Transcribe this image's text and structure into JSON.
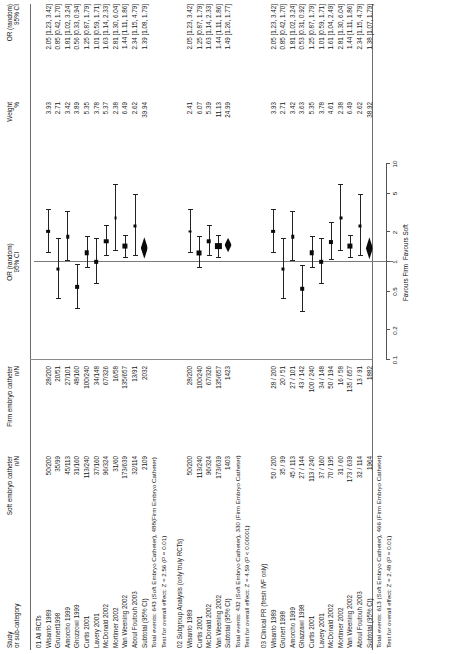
{
  "headers": {
    "study_l1": "Study",
    "study_l2": "or sub-category",
    "soft_l1": "Soft embryo catheter",
    "soft_l2": "n/N",
    "firm_l1": "Firm embryo catheter",
    "firm_l2": "n/N",
    "plot_l1": "OR (random)",
    "plot_l2": "95% CI",
    "weight_l1": "Weight",
    "weight_l2": "%",
    "or_l1": "OR (random)",
    "or_l2": "95% CI"
  },
  "axis": {
    "ticks": [
      "0.1",
      "0.2",
      "0.5",
      "1",
      "2",
      "5",
      "10"
    ],
    "favours_left": "Favours Firm",
    "favours_right": "Favours Soft"
  },
  "chart_data": {
    "type": "forest",
    "xlabel": "OR (random) 95% CI",
    "xscale": "log",
    "xlim": [
      0.1,
      10
    ],
    "xticks": [
      0.1,
      0.2,
      0.5,
      1,
      2,
      5,
      10
    ],
    "null_line": 1,
    "favours_left": "Favours Firm",
    "favours_right": "Favours Soft",
    "sections": [
      {
        "id": "01",
        "label": "01 All RCTs",
        "rows": [
          {
            "study": "Wisanto 1989",
            "soft": "50/200",
            "firm": "28/200",
            "weight": "3.93",
            "or": "2.05 [1.23, 3.42]",
            "est": 2.05,
            "lo": 1.23,
            "hi": 3.42
          },
          {
            "study": "Grunert1998",
            "soft": "35/99",
            "firm": "20/51",
            "weight": "2.71",
            "or": "0.85 [0.42, 1.70]",
            "est": 0.85,
            "lo": 0.42,
            "hi": 1.7
          },
          {
            "study": "Amorcho 1999",
            "soft": "45/113",
            "firm": "27/101",
            "weight": "3.42",
            "or": "1.81 [1.02, 3.24]",
            "est": 1.81,
            "lo": 1.02,
            "hi": 3.24
          },
          {
            "study": "Ghozzowi 1999",
            "soft": "31/160",
            "firm": "48/160",
            "weight": "3.89",
            "or": "0.56 [0.33, 0.94]",
            "est": 0.56,
            "lo": 0.33,
            "hi": 0.94
          },
          {
            "study": "Curtis 2001",
            "soft": "113/240",
            "firm": "100/240",
            "weight": "5.35",
            "or": "1.25 [0.87, 1.79]",
            "est": 1.25,
            "lo": 0.87,
            "hi": 1.79
          },
          {
            "study": "Lavery 2001",
            "soft": "37/160",
            "firm": "34/148",
            "weight": "3.78",
            "or": "1.01 [0.59, 1.71]",
            "est": 1.01,
            "lo": 0.59,
            "hi": 1.71
          },
          {
            "study": "McDonald 2002",
            "soft": "96/324",
            "firm": "67/326",
            "weight": "5.37",
            "or": "1.63 [1.14, 2.33]",
            "est": 1.63,
            "lo": 1.14,
            "hi": 2.33
          },
          {
            "study": "Mortimer 2002",
            "soft": "31/60",
            "firm": "16/58",
            "weight": "2.38",
            "or": "2.81 [1.30, 6.04]",
            "est": 2.81,
            "lo": 1.3,
            "hi": 6.04
          },
          {
            "study": "Van Weening 2002",
            "soft": "173/639",
            "firm": "135/657",
            "weight": "6.49",
            "or": "1.44 [1.11, 1.86]",
            "est": 1.44,
            "lo": 1.11,
            "hi": 1.86
          },
          {
            "study": "Aboul Foutouh 2003",
            "soft": "32/114",
            "firm": "13/91",
            "weight": "2.62",
            "or": "2.34 [1.15, 4.79]",
            "est": 2.34,
            "lo": 1.15,
            "hi": 4.79
          }
        ],
        "subtotal": {
          "study": "Subtotal (95% CI)",
          "soft": "2109",
          "firm": "2032",
          "weight": "39.94",
          "or": "1.39 [1.08, 1.79]",
          "est": 1.39,
          "lo": 1.08,
          "hi": 1.79
        },
        "notes": [
          "Total events: 643 (Soft Embryo Catheter), 488(Firm Embryo Catheter)",
          "Test for overall effect: Z = 2.56 (P = 0.01)"
        ]
      },
      {
        "id": "02",
        "label": "02 Subgroup Analysis (only truly RCTs)",
        "rows": [
          {
            "study": "Wisanto 1989",
            "soft": "50/200",
            "firm": "28/200",
            "weight": "2.41",
            "or": "2.05 [1.23, 3.42]",
            "est": 2.05,
            "lo": 1.23,
            "hi": 3.42
          },
          {
            "study": "Curtis 2001",
            "soft": "113/240",
            "firm": "100/240",
            "weight": "6.07",
            "or": "1.25 [0.87, 1.79]",
            "est": 1.25,
            "lo": 0.87,
            "hi": 1.79
          },
          {
            "study": "McDonald 2002",
            "soft": "96/324",
            "firm": "67/326",
            "weight": "5.39",
            "or": "1.63 [1.14, 2.33]",
            "est": 1.63,
            "lo": 1.14,
            "hi": 2.33
          },
          {
            "study": "Van Weening 2002",
            "soft": "173/639",
            "firm": "135/657",
            "weight": "11.13",
            "or": "1.44 [1.11, 1.86]",
            "est": 1.44,
            "lo": 1.11,
            "hi": 1.86
          }
        ],
        "subtotal": {
          "study": "Subtotal (95% CI)",
          "soft": "1403",
          "firm": "1423",
          "weight": "24.99",
          "or": "1.49 [1.26, 1.77]",
          "est": 1.49,
          "lo": 1.26,
          "hi": 1.77
        },
        "notes": [
          "Total events: 432 (Soft Embryo Catheter), 330 (Firm Embryo Catheter)",
          "Test for overall effect: Z = 4.59 (P < 0.00001)"
        ]
      },
      {
        "id": "03",
        "label": "03 Clinical PR (fresh IVF only)",
        "rows": [
          {
            "study": "Wisanto 1989",
            "soft": "50 / 200",
            "firm": "28 / 200",
            "weight": "3.93",
            "or": "2.05 [1.23, 3.42]",
            "est": 2.05,
            "lo": 1.23,
            "hi": 3.42
          },
          {
            "study": "Grunert 1998",
            "soft": "35 / 99",
            "firm": "20 / 51",
            "weight": "2.71",
            "or": "0.85 [0.42, 1.70]",
            "est": 0.85,
            "lo": 0.42,
            "hi": 1.7
          },
          {
            "study": "Amorcho 1999",
            "soft": "45 / 113",
            "firm": "27 / 101",
            "weight": "3.42",
            "or": "1.81 [1.02, 3.24]",
            "est": 1.81,
            "lo": 1.02,
            "hi": 3.24
          },
          {
            "study": "Ghazzawi 1998",
            "soft": "27 / 144",
            "firm": "43 / 142",
            "weight": "3.63",
            "or": "0.53 [0.31, 0.92]",
            "est": 0.53,
            "lo": 0.31,
            "hi": 0.92
          },
          {
            "study": "Curtis 2001",
            "soft": "113 / 240",
            "firm": "100 / 240",
            "weight": "5.35",
            "or": "1.25 [0.87, 1.79]",
            "est": 1.25,
            "lo": 0.87,
            "hi": 1.79
          },
          {
            "study": "Lavery 2001",
            "soft": "37 / 160",
            "firm": "34 / 148",
            "weight": "3.78",
            "or": "1.01 [0.59, 1.71]",
            "est": 1.01,
            "lo": 0.59,
            "hi": 1.71
          },
          {
            "study": "McDonald 2002",
            "soft": "70 / 195",
            "firm": "50 / 194",
            "weight": "4.61",
            "or": "1.61 [1.04, 2.49]",
            "est": 1.61,
            "lo": 1.04,
            "hi": 2.49
          },
          {
            "study": "Mortimer 2002",
            "soft": "31 / 60",
            "firm": "16 / 58",
            "weight": "2.38",
            "or": "2.81 [1.30, 6.04]",
            "est": 2.81,
            "lo": 1.3,
            "hi": 6.04
          },
          {
            "study": "Van Weening 2002",
            "soft": "173 / 639",
            "firm": "135 / 657",
            "weight": "6.49",
            "or": "1.44 [1.11, 1.86]",
            "est": 1.44,
            "lo": 1.11,
            "hi": 1.86
          },
          {
            "study": "Aboul Foutouh 2003",
            "soft": "32 / 114",
            "firm": "13 / 91",
            "weight": "2.62",
            "or": "2.34 [1.15, 4.79]",
            "est": 2.34,
            "lo": 1.15,
            "hi": 4.79
          }
        ],
        "subtotal": {
          "study": "Subtotal (95% CI)",
          "soft": "1964",
          "firm": "1882",
          "weight": "38.92",
          "or": "1.38 [1.07, 1.79]",
          "est": 1.38,
          "lo": 1.07,
          "hi": 1.79
        },
        "notes": [
          "Total events: 613 (Soft Embryo Catheter), 466 (Firm Embryo Catheter)",
          "Test for overall effect: Z = 2.48 (P = 0.01)"
        ]
      }
    ]
  }
}
